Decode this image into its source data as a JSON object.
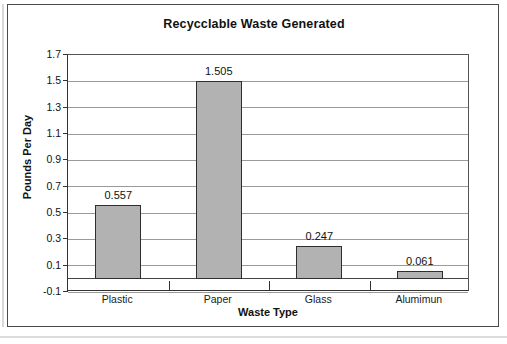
{
  "chart_data": {
    "type": "bar",
    "title": "Recycclable Waste Generated",
    "xlabel": "Waste Type",
    "ylabel": "Pounds Per Day",
    "categories": [
      "Plastic",
      "Paper",
      "Glass",
      "Alumimun"
    ],
    "values": [
      0.557,
      1.505,
      0.247,
      0.061
    ],
    "value_labels": [
      "0.557",
      "1.505",
      "0.247",
      "0.061"
    ],
    "ylim": [
      -0.1,
      1.7
    ],
    "ytick_step": 0.2,
    "ytick_labels": [
      "1.7",
      "1.5",
      "1.3",
      "1.1",
      "0.9",
      "0.7",
      "0.5",
      "0.3",
      "0.1",
      "-0.1"
    ],
    "ytick_values": [
      1.7,
      1.5,
      1.3,
      1.1,
      0.9,
      0.7,
      0.5,
      0.3,
      0.1,
      -0.1
    ],
    "grid": true,
    "grid_axis": "y",
    "legend": false,
    "legend_position": "none",
    "series": [
      {
        "name": "Pounds Per Day",
        "values": [
          0.557,
          1.505,
          0.247,
          0.061
        ],
        "bar_color": "#b2b2b2",
        "bar_border_color": "#2e2e2e"
      }
    ]
  },
  "style": {
    "background": "#ffffff",
    "frame_color": "#4a4a4a",
    "gridline_color": "#9a9a9a",
    "axis_color": "#333333",
    "text_color": "#111111"
  }
}
